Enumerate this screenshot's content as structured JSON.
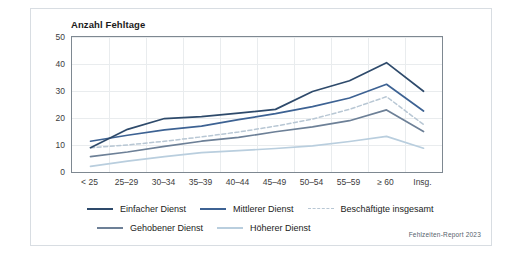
{
  "figure": {
    "title": "Anzahl Fehltage",
    "source": "Fehlzeiten-Report 2023"
  },
  "colors": {
    "einfacher": "#2e4a6b",
    "mittlerer": "#3d6293",
    "beschaeftigte": "#b8c7d4",
    "gehobener": "#6d8097",
    "hoeherer": "#b9cede",
    "grid": "#e9ecee",
    "axis": "#7e8891",
    "frame": "#d8dde2",
    "text": "#1b1b1b"
  },
  "chart_data": {
    "type": "line",
    "title": "Anzahl Fehltage",
    "xlabel": "",
    "ylabel": "Anzahl Fehltage",
    "ylim": [
      0,
      50
    ],
    "yticks": [
      0,
      10,
      20,
      30,
      40,
      50
    ],
    "grid": true,
    "legend_position": "bottom",
    "categories": [
      "< 25",
      "25–29",
      "30–34",
      "35–39",
      "40–44",
      "45–49",
      "50–54",
      "55–59",
      "≥ 60",
      "Insg."
    ],
    "series": [
      {
        "name": "Einfacher Dienst",
        "style": "solid",
        "color": "#2e4a6b",
        "values": [
          9.0,
          15.8,
          19.8,
          20.5,
          21.8,
          23.2,
          29.8,
          33.8,
          40.5,
          29.9
        ]
      },
      {
        "name": "Mittlerer Dienst",
        "style": "solid",
        "color": "#3d6293",
        "values": [
          11.4,
          13.6,
          15.6,
          17.0,
          19.4,
          21.6,
          24.2,
          27.4,
          32.5,
          22.6
        ]
      },
      {
        "name": "Beschäftigte insgesamt",
        "style": "dashed",
        "color": "#b8c7d4",
        "values": [
          9.0,
          10.0,
          11.4,
          13.0,
          14.8,
          17.0,
          19.6,
          23.2,
          27.9,
          17.6
        ]
      },
      {
        "name": "Gehobener Dienst",
        "style": "solid",
        "color": "#6d8097",
        "values": [
          5.7,
          7.4,
          9.5,
          11.4,
          12.8,
          14.9,
          16.7,
          19.0,
          23.0,
          15.0
        ]
      },
      {
        "name": "Höherer Dienst",
        "style": "solid",
        "color": "#b9cede",
        "values": [
          2.1,
          4.0,
          5.7,
          7.2,
          7.9,
          8.7,
          9.7,
          11.3,
          13.2,
          8.8
        ]
      }
    ]
  },
  "legend": {
    "row1": [
      "Einfacher Dienst",
      "Mittlerer Dienst",
      "Beschäftigte insgesamt"
    ],
    "row2": [
      "Gehobener Dienst",
      "Höherer Dienst"
    ]
  }
}
